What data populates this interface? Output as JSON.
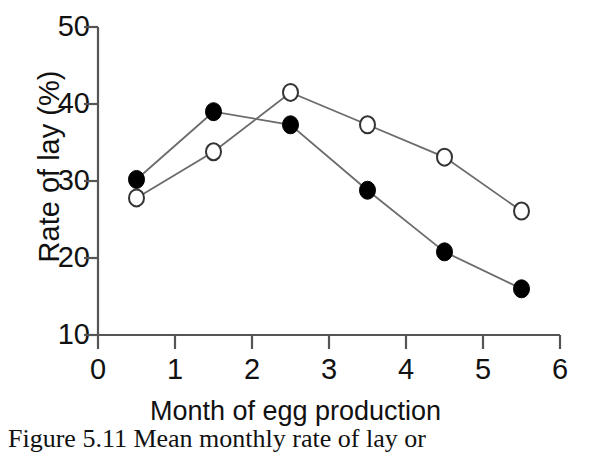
{
  "figure": {
    "caption": "Figure 5.11 Mean monthly rate of lay or",
    "background_color": "#ffffff",
    "axis_color": "#555555",
    "marker_fill_color": "#000000",
    "marker_open_color": "#ffffff"
  },
  "chart_data": {
    "type": "line",
    "title": "",
    "subtitle": "",
    "xlabel": "Month of egg production",
    "ylabel": "Rate of lay (%)",
    "xlim": [
      0,
      6
    ],
    "ylim": [
      10,
      50
    ],
    "xticks": [
      0,
      1,
      2,
      3,
      4,
      5,
      6
    ],
    "yticks": [
      10,
      20,
      30,
      40,
      50
    ],
    "xtick_labels": [
      "0",
      "1",
      "2",
      "3",
      "4",
      "5",
      "6"
    ],
    "ytick_labels": [
      "10",
      "20",
      "30",
      "40",
      "50"
    ],
    "grid": false,
    "legend": null,
    "legend_position": "none",
    "x": [
      0.5,
      1.5,
      2.5,
      3.5,
      4.5,
      5.5
    ],
    "series": [
      {
        "name": "filled-circle-series",
        "marker": "filled-circle",
        "marker_color": "#000000",
        "line_color": "#6b6b6b",
        "values": [
          30.2,
          39.0,
          37.3,
          28.8,
          20.8,
          16.0
        ]
      },
      {
        "name": "open-circle-series",
        "marker": "open-circle",
        "marker_color": "#ffffff",
        "marker_stroke": "#333333",
        "line_color": "#6b6b6b",
        "values": [
          27.8,
          33.8,
          41.5,
          37.3,
          33.1,
          26.1
        ]
      }
    ]
  }
}
